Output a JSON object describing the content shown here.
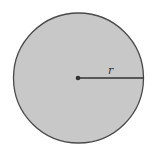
{
  "diagram": {
    "shape": "circle",
    "fill_color": "#c8c8c8",
    "stroke_color": "#4a4a4a",
    "center": {
      "x": 78,
      "y": 78
    },
    "radius_px": 65,
    "radius_label": "r",
    "center_marker": "dot"
  }
}
